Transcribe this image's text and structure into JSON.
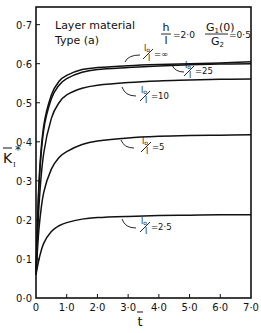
{
  "chart_data": {
    "type": "line",
    "title": "",
    "xlabel": "t̄",
    "ylabel": "K̄I*",
    "xlim": [
      0,
      7.0
    ],
    "ylim": [
      0.0,
      0.75
    ],
    "grid": false,
    "x_ticks": [
      "0",
      "1·0",
      "2·0",
      "3·0",
      "4·0",
      "5·0",
      "6·0",
      "7·0"
    ],
    "y_ticks": [
      "0·0",
      "0·1",
      "0·2",
      "0·3",
      "0·4",
      "0·5",
      "0·6",
      "0·7"
    ],
    "annotations": {
      "material": [
        "Layer material",
        "Type (a)"
      ],
      "h_over_l": "h/l = 2·0",
      "g_ratio": "G1(0)/G2 = 0·5"
    },
    "series": [
      {
        "name": "lo/l = ∞",
        "label_value": "=∞",
        "x": [
          0,
          0.1,
          0.25,
          0.5,
          0.75,
          1.0,
          1.5,
          2.0,
          3.0,
          4.0,
          5.0,
          6.0,
          7.0
        ],
        "values": [
          0.06,
          0.3,
          0.44,
          0.52,
          0.555,
          0.57,
          0.585,
          0.59,
          0.595,
          0.598,
          0.6,
          0.602,
          0.605
        ]
      },
      {
        "name": "lo/l = 25",
        "label_value": "=25",
        "x": [
          0,
          0.1,
          0.25,
          0.5,
          0.75,
          1.0,
          1.5,
          2.0,
          3.0,
          4.0,
          5.0,
          6.0,
          7.0
        ],
        "values": [
          0.06,
          0.29,
          0.43,
          0.51,
          0.545,
          0.562,
          0.578,
          0.585,
          0.59,
          0.594,
          0.597,
          0.599,
          0.6
        ]
      },
      {
        "name": "lo/l = 10",
        "label_value": "=10",
        "x": [
          0,
          0.1,
          0.25,
          0.5,
          0.75,
          1.0,
          1.5,
          2.0,
          3.0,
          4.0,
          5.0,
          6.0,
          7.0
        ],
        "values": [
          0.06,
          0.24,
          0.37,
          0.46,
          0.5,
          0.52,
          0.537,
          0.545,
          0.552,
          0.556,
          0.558,
          0.56,
          0.561
        ]
      },
      {
        "name": "lo/l = 5",
        "label_value": "=5",
        "x": [
          0,
          0.1,
          0.25,
          0.5,
          0.75,
          1.0,
          1.5,
          2.0,
          3.0,
          4.0,
          5.0,
          6.0,
          7.0
        ],
        "values": [
          0.06,
          0.18,
          0.27,
          0.33,
          0.36,
          0.375,
          0.393,
          0.402,
          0.41,
          0.414,
          0.416,
          0.417,
          0.418
        ]
      },
      {
        "name": "lo/l = 2.5",
        "label_value": "=2·5",
        "x": [
          0,
          0.1,
          0.25,
          0.5,
          0.75,
          1.0,
          1.5,
          2.0,
          3.0,
          4.0,
          5.0,
          6.0,
          7.0
        ],
        "values": [
          0.06,
          0.1,
          0.14,
          0.17,
          0.185,
          0.193,
          0.202,
          0.206,
          0.209,
          0.211,
          0.212,
          0.213,
          0.213
        ]
      }
    ]
  },
  "labels": {
    "annot_line1": "Layer material",
    "annot_line2": "Type (a)",
    "h_num": "h",
    "h_den": "l",
    "h_val": "=2·0",
    "g_num": "G",
    "g_num_sub": "1",
    "g_num_arg": "(0)",
    "g_den": "G",
    "g_den_sub": "2",
    "g_val": "=0·5",
    "lo_num": "l",
    "lo_num_sub": "o",
    "lo_den": "l",
    "xlabel": "t",
    "ylabel": "K",
    "ylabel_sub": "I",
    "ylabel_sup": "*"
  }
}
